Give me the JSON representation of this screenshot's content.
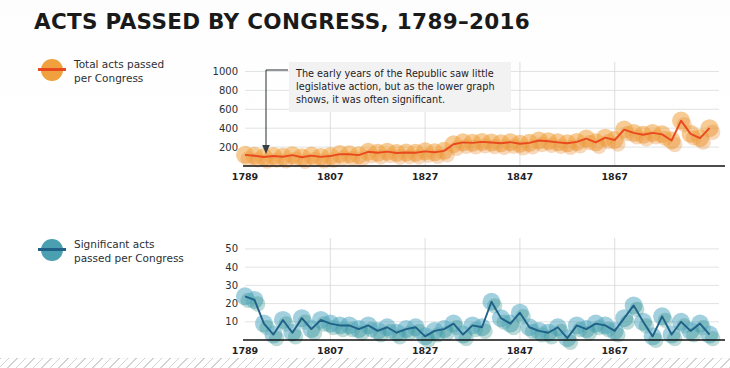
{
  "page": {
    "title": "ACTS PASSED BY CONGRESS, 1789–2016",
    "background_color": "#ffffff"
  },
  "colors": {
    "total_line": "#e8491f",
    "total_dot": "#f0a03c",
    "total_dot_alpha": "#eda23f",
    "significant_line": "#1f6187",
    "significant_dot": "#4ea3bd",
    "significant_dot_alt": "#2f8f86",
    "grid": "#d9dadb",
    "axis": "#111111",
    "text": "#1f2326",
    "annotation_bg": "#f2f2f2"
  },
  "legends": [
    {
      "id": "total",
      "label": "Total acts passed\nper Congress",
      "marker_icon": "filled-circle-with-line",
      "dot_color": "#f0a03c",
      "line_color": "#e8491f"
    },
    {
      "id": "significant",
      "label": "Significant acts\npassed per Congress",
      "marker_icon": "filled-circle-with-line",
      "dot_color": "#4a9fb0",
      "line_color": "#1f6187"
    }
  ],
  "annotation": {
    "text": "The early years of the Republic saw little legislative action, but as the lower graph shows, it was often significant.",
    "arrow_icon": "down-arrow",
    "arrow_target_year": 1789
  },
  "chart_data": [
    {
      "id": "total-acts",
      "type": "line",
      "title": "Total acts passed per Congress",
      "xlabel": "",
      "ylabel": "",
      "ylim": [
        0,
        1100
      ],
      "yticks": [
        200,
        400,
        600,
        800,
        1000
      ],
      "xlim": [
        1789,
        1889
      ],
      "xticks": [
        1789,
        1807,
        1827,
        1847,
        1867
      ],
      "xtick_labels": [
        "1789",
        "1807",
        "1827",
        "1847",
        "1867"
      ],
      "grid": true,
      "legend_position": "left-outside",
      "marker_style": "translucent-circle",
      "x": [
        1789,
        1791,
        1793,
        1795,
        1797,
        1799,
        1801,
        1803,
        1805,
        1807,
        1809,
        1811,
        1813,
        1815,
        1817,
        1819,
        1821,
        1823,
        1825,
        1827,
        1829,
        1831,
        1833,
        1835,
        1837,
        1839,
        1841,
        1843,
        1845,
        1847,
        1849,
        1851,
        1853,
        1855,
        1857,
        1859,
        1861,
        1863,
        1865,
        1867,
        1869,
        1871,
        1873,
        1875,
        1877,
        1879,
        1881,
        1883,
        1885,
        1887
      ],
      "values": [
        118,
        108,
        95,
        105,
        98,
        115,
        92,
        110,
        96,
        105,
        126,
        124,
        115,
        150,
        140,
        152,
        138,
        142,
        140,
        155,
        145,
        160,
        230,
        250,
        245,
        255,
        248,
        240,
        252,
        235,
        245,
        270,
        262,
        250,
        240,
        255,
        290,
        250,
        300,
        275,
        385,
        350,
        330,
        350,
        335,
        270,
        480,
        340,
        295,
        400
      ]
    },
    {
      "id": "significant-acts",
      "type": "line",
      "title": "Significant acts passed per Congress",
      "xlabel": "",
      "ylabel": "",
      "ylim": [
        0,
        56
      ],
      "yticks": [
        10,
        20,
        30,
        40,
        50
      ],
      "xlim": [
        1789,
        1889
      ],
      "xticks": [
        1789,
        1807,
        1827,
        1847,
        1867
      ],
      "xtick_labels": [
        "1789",
        "1807",
        "1827",
        "1847",
        "1867"
      ],
      "grid": true,
      "legend_position": "left-outside",
      "marker_style": "translucent-circle",
      "x": [
        1789,
        1791,
        1793,
        1795,
        1797,
        1799,
        1801,
        1803,
        1805,
        1807,
        1809,
        1811,
        1813,
        1815,
        1817,
        1819,
        1821,
        1823,
        1825,
        1827,
        1829,
        1831,
        1833,
        1835,
        1837,
        1839,
        1841,
        1843,
        1845,
        1847,
        1849,
        1851,
        1853,
        1855,
        1857,
        1859,
        1861,
        1863,
        1865,
        1867,
        1869,
        1871,
        1873,
        1875,
        1877,
        1879,
        1881,
        1883,
        1885,
        1887
      ],
      "values": [
        24,
        22,
        9,
        3,
        11,
        4,
        12,
        6,
        11,
        9,
        8,
        8,
        6,
        8,
        5,
        7,
        4,
        6,
        7,
        2,
        5,
        6,
        9,
        3,
        8,
        7,
        21,
        12,
        9,
        15,
        7,
        5,
        4,
        7,
        1,
        8,
        6,
        9,
        8,
        5,
        12,
        19,
        10,
        2,
        13,
        3,
        10,
        5,
        9,
        3
      ]
    }
  ]
}
